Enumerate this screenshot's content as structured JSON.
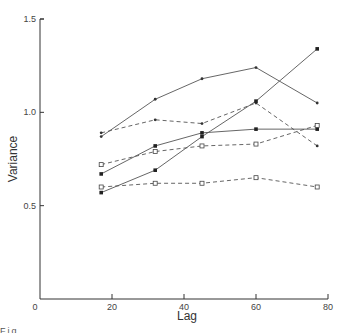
{
  "chart_data": {
    "type": "line",
    "title": "",
    "xlabel": "Lag",
    "ylabel": "Variance",
    "xlim": [
      0,
      80
    ],
    "ylim": [
      0,
      1.5
    ],
    "x_ticks": [
      "0",
      "20",
      "40",
      "60",
      "80"
    ],
    "y_ticks": [
      "0.5",
      "1.0",
      "1.5"
    ],
    "grid": false,
    "legend": null,
    "x": [
      17,
      32,
      45,
      60,
      77
    ],
    "series": [
      {
        "name": "solid-dot-upper",
        "style": "solid",
        "marker": "dot",
        "values": [
          0.87,
          1.07,
          1.18,
          1.24,
          1.05
        ]
      },
      {
        "name": "dashed-dot",
        "style": "dashed",
        "marker": "dot",
        "values": [
          0.89,
          0.96,
          0.94,
          1.05,
          0.82
        ]
      },
      {
        "name": "solid-filled-square",
        "style": "solid",
        "marker": "filled-square",
        "values": [
          0.67,
          0.82,
          0.89,
          0.91,
          0.91
        ]
      },
      {
        "name": "dashed-open-square-upper",
        "style": "dashed",
        "marker": "open-square",
        "values": [
          0.72,
          0.79,
          0.82,
          0.83,
          0.93
        ]
      },
      {
        "name": "solid-filled-square-steep",
        "style": "solid",
        "marker": "filled-square",
        "values": [
          0.57,
          0.69,
          0.87,
          1.06,
          1.34
        ]
      },
      {
        "name": "dashed-open-square-lower",
        "style": "dashed",
        "marker": "open-square",
        "values": [
          0.6,
          0.62,
          0.62,
          0.65,
          0.6
        ]
      }
    ]
  },
  "caption": "Fig. . . . . . . . . . . . . . . . . . . . . . . . . ."
}
